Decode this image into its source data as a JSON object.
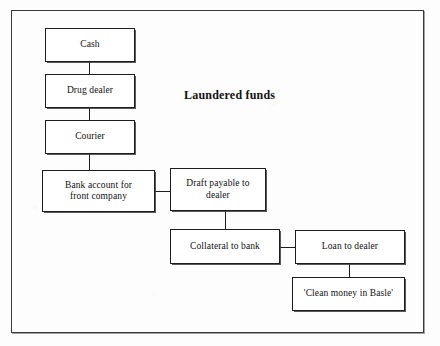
{
  "diagram": {
    "title": "Laundered funds",
    "type": "flowchart",
    "frame": {
      "x": 11,
      "y": 10,
      "width": 413,
      "height": 323
    },
    "title_position": {
      "x": 184,
      "y": 88
    },
    "nodes": [
      {
        "id": "cash",
        "label": "Cash",
        "x": 45,
        "y": 28,
        "width": 90,
        "height": 34
      },
      {
        "id": "drug-dealer",
        "label": "Drug dealer",
        "x": 45,
        "y": 74,
        "width": 90,
        "height": 34
      },
      {
        "id": "courier",
        "label": "Courier",
        "x": 45,
        "y": 120,
        "width": 90,
        "height": 34
      },
      {
        "id": "bank-account",
        "label": "Bank account for\nfront company",
        "x": 42,
        "y": 170,
        "width": 113,
        "height": 42
      },
      {
        "id": "draft",
        "label": "Draft payable to\ndealer",
        "x": 170,
        "y": 168,
        "width": 96,
        "height": 43
      },
      {
        "id": "collateral",
        "label": "Collateral to bank",
        "x": 170,
        "y": 229,
        "width": 110,
        "height": 35
      },
      {
        "id": "loan",
        "label": "Loan to dealer",
        "x": 295,
        "y": 230,
        "width": 110,
        "height": 34
      },
      {
        "id": "clean-money",
        "label": "'Clean money in Basle'",
        "x": 292,
        "y": 277,
        "width": 113,
        "height": 34
      }
    ],
    "edges": [
      {
        "id": "cash-to-drug-dealer",
        "from": "cash",
        "to": "drug-dealer",
        "orientation": "vertical",
        "x": 89,
        "y": 62,
        "length": 12
      },
      {
        "id": "drug-dealer-to-courier",
        "from": "drug-dealer",
        "to": "courier",
        "orientation": "vertical",
        "x": 89,
        "y": 108,
        "length": 12
      },
      {
        "id": "courier-to-bank-account",
        "from": "courier",
        "to": "bank-account",
        "orientation": "vertical",
        "x": 89,
        "y": 154,
        "length": 16
      },
      {
        "id": "bank-account-to-draft",
        "from": "bank-account",
        "to": "draft",
        "orientation": "horizontal",
        "x": 155,
        "y": 191,
        "length": 15
      },
      {
        "id": "draft-to-collateral",
        "from": "draft",
        "to": "collateral",
        "orientation": "vertical",
        "x": 225,
        "y": 211,
        "length": 18
      },
      {
        "id": "collateral-to-loan",
        "from": "collateral",
        "to": "loan",
        "orientation": "horizontal",
        "x": 280,
        "y": 247,
        "length": 15
      },
      {
        "id": "loan-to-clean-money",
        "from": "loan",
        "to": "clean-money",
        "orientation": "vertical",
        "x": 349,
        "y": 264,
        "length": 13
      }
    ]
  }
}
